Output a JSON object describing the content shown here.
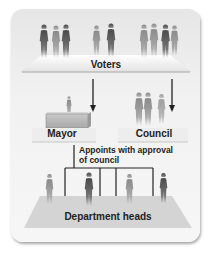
{
  "diagram": {
    "type": "organizational-flow",
    "title": "",
    "nodes": [
      {
        "id": "voters",
        "label": "Voters"
      },
      {
        "id": "mayor",
        "label": "Mayor"
      },
      {
        "id": "council",
        "label": "Council"
      },
      {
        "id": "department_heads",
        "label": "Department heads"
      }
    ],
    "edges": [
      {
        "from": "voters",
        "to": "mayor",
        "type": "arrow"
      },
      {
        "from": "voters",
        "to": "council",
        "type": "arrow"
      },
      {
        "from": "mayor",
        "to": "department_heads",
        "type": "line",
        "label_line1": "Appoints with approval",
        "label_line2": "of council"
      }
    ],
    "colors": {
      "card_bg": "#f0f0f0",
      "platform": "#d6d6d6",
      "figure_dark": "#555555",
      "figure_light": "#9a9a9a",
      "line": "#222222",
      "text": "#222222"
    }
  }
}
